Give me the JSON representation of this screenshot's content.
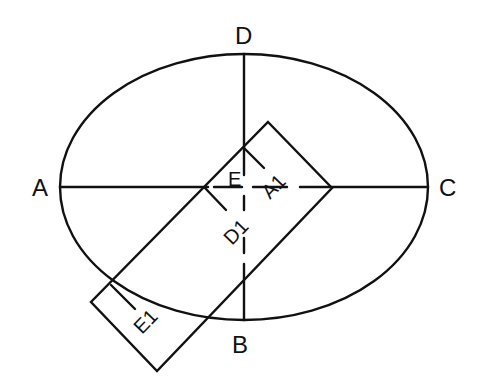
{
  "diagram": {
    "type": "geometric-construction",
    "stroke_color": "#111111",
    "background": "#ffffff",
    "ellipse": {
      "cx": 244,
      "cy": 187,
      "rx": 184,
      "ry": 133
    },
    "axis_labels": {
      "A": "A",
      "B": "B",
      "C": "C",
      "D": "D"
    },
    "inner_labels": {
      "E": "E",
      "A1": "A1",
      "D1": "D1",
      "E1": "E1"
    },
    "rectangle": {
      "corners": [
        [
          268,
          122
        ],
        [
          332,
          188
        ],
        [
          157,
          371
        ],
        [
          91,
          302
        ]
      ],
      "rotation_deg": -46
    }
  }
}
